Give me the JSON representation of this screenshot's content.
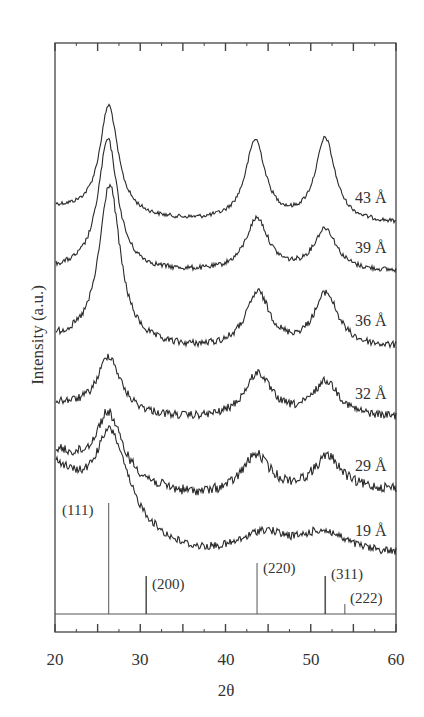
{
  "chart_data": {
    "type": "line",
    "title": "",
    "xlabel": "2θ",
    "ylabel": "Intensity (a.u.)",
    "xlim": [
      20,
      60
    ],
    "x_ticks": [
      20,
      30,
      40,
      50,
      60
    ],
    "x_tick_labels": [
      "20",
      "30",
      "40",
      "50",
      "60"
    ],
    "minor_tick_step": 2.5,
    "grid": false,
    "legend": "inline labels at right end of each trace",
    "series": [
      {
        "name": "43 Å",
        "label": "43 Å",
        "baseline_left": 208,
        "baseline_right": 224,
        "valley": 222,
        "noise": 2,
        "peaks": [
          {
            "x": 26.3,
            "y": 106,
            "w": 1.3
          },
          {
            "x": 43.5,
            "y": 142,
            "w": 1.4
          },
          {
            "x": 51.7,
            "y": 140,
            "w": 1.4
          }
        ],
        "label_y": 198
      },
      {
        "name": "39 Å",
        "label": "39 Å",
        "baseline_left": 270,
        "baseline_right": 272,
        "valley": 273,
        "noise": 2.5,
        "peaks": [
          {
            "x": 26.2,
            "y": 140,
            "w": 1.4
          },
          {
            "x": 43.7,
            "y": 220,
            "w": 1.6
          },
          {
            "x": 51.7,
            "y": 230,
            "w": 1.6
          }
        ],
        "label_y": 248
      },
      {
        "name": "36 Å",
        "label": "36 Å",
        "baseline_left": 340,
        "baseline_right": 348,
        "valley": 350,
        "noise": 3.5,
        "peaks": [
          {
            "x": 26.4,
            "y": 185,
            "w": 1.5
          },
          {
            "x": 43.8,
            "y": 295,
            "w": 1.7
          },
          {
            "x": 51.8,
            "y": 295,
            "w": 1.7
          }
        ],
        "label_y": 321
      },
      {
        "name": "32 Å",
        "label": "32 Å",
        "baseline_left": 403,
        "baseline_right": 418,
        "valley": 420,
        "noise": 4,
        "peaks": [
          {
            "x": 26.3,
            "y": 356,
            "w": 1.6
          },
          {
            "x": 43.8,
            "y": 375,
            "w": 1.9
          },
          {
            "x": 51.8,
            "y": 383,
            "w": 1.9
          }
        ],
        "label_y": 394
      },
      {
        "name": "29 Å",
        "label": "29 Å",
        "baseline_left": 450,
        "baseline_right": 490,
        "valley": 497,
        "noise": 5,
        "peaks": [
          {
            "x": 26.2,
            "y": 412,
            "w": 1.8
          },
          {
            "x": 43.6,
            "y": 457,
            "w": 2.0
          },
          {
            "x": 52.0,
            "y": 458,
            "w": 2.0
          }
        ],
        "label_y": 466
      },
      {
        "name": "19 Å",
        "label": "19 Å",
        "baseline_left": 460,
        "baseline_right": 555,
        "valley": 555,
        "noise": 4,
        "peaks": [
          {
            "x": 26.4,
            "y": 428,
            "w": 2.2
          },
          {
            "x": 44.5,
            "y": 535,
            "w": 3.0
          },
          {
            "x": 51.5,
            "y": 534,
            "w": 3.2
          }
        ],
        "label_y": 530
      }
    ],
    "reference_lines": [
      {
        "hkl": "(111)",
        "x": 26.3,
        "top_y": 503,
        "label_x": 62,
        "label_y": 511
      },
      {
        "hkl": "(200)",
        "x": 30.7,
        "top_y": 576,
        "label_x": 152,
        "label_y": 576
      },
      {
        "hkl": "(220)",
        "x": 43.7,
        "top_y": 563,
        "label_x": 263,
        "label_y": 560
      },
      {
        "hkl": "(311)",
        "x": 51.7,
        "top_y": 576,
        "label_x": 331,
        "label_y": 573
      },
      {
        "hkl": "(222)",
        "x": 54.0,
        "top_y": 604,
        "label_x": 350,
        "label_y": 594
      }
    ]
  },
  "axes": {
    "xlabel": "2θ",
    "ylabel": "Intensity (a.u.)",
    "tick_labels": [
      "20",
      "30",
      "40",
      "50",
      "60"
    ]
  },
  "labels": {
    "s0": "43 Å",
    "s1": "39 Å",
    "s2": "36 Å",
    "s3": "32 Å",
    "s4": "29 Å",
    "s5": "19 Å",
    "r0": "(111)",
    "r1": "(200)",
    "r2": "(220)",
    "r3": "(311)",
    "r4": "(222)"
  },
  "colors": {
    "trace": "#2a2a2a",
    "frame": "#444444",
    "reference": "#555555"
  }
}
